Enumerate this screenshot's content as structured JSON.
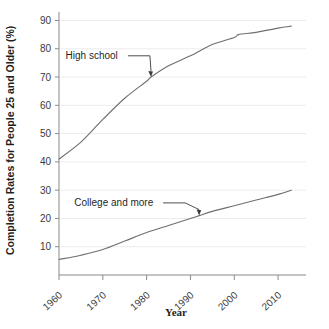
{
  "chart_data": {
    "type": "line",
    "title": "",
    "xlabel": "Year",
    "ylabel": "Completion Rates for People 25 and Older (%)",
    "xlim": [
      1960,
      2015
    ],
    "ylim": [
      0,
      93
    ],
    "xticks": [
      1960,
      1970,
      1980,
      1990,
      2000,
      2010
    ],
    "xtick_labels": [
      "1960",
      "1970",
      "1980",
      "1990",
      "2000",
      "2010"
    ],
    "yticks": [
      10,
      20,
      30,
      40,
      50,
      60,
      70,
      80,
      90
    ],
    "ytick_labels": [
      "10",
      "20",
      "30",
      "40",
      "50",
      "60",
      "70",
      "80",
      "90"
    ],
    "grid": "horizontal-faint",
    "legend_position": "inline-annotations",
    "series": [
      {
        "name": "High school",
        "x": [
          1960,
          1965,
          1970,
          1975,
          1980,
          1981,
          1985,
          1990,
          1995,
          2000,
          2001,
          2005,
          2010,
          2013
        ],
        "values": [
          41.0,
          47.0,
          55.0,
          62.5,
          68.5,
          70.0,
          74.0,
          77.5,
          81.5,
          84.0,
          85.0,
          85.8,
          87.3,
          88.0
        ]
      },
      {
        "name": "College and more",
        "x": [
          1960,
          1965,
          1970,
          1975,
          1980,
          1985,
          1990,
          1992,
          1995,
          2000,
          2005,
          2010,
          2013
        ],
        "values": [
          5.5,
          7.0,
          9.0,
          12.0,
          15.0,
          17.5,
          20.0,
          21.0,
          22.5,
          24.5,
          26.5,
          28.5,
          30.0
        ]
      }
    ],
    "annotations": [
      {
        "label": "High school",
        "label_x": 1961.5,
        "label_y": 77.5,
        "target_x": 1981,
        "target_y": 70.0
      },
      {
        "label": "College and more",
        "label_x": 1963.5,
        "label_y": 25.5,
        "target_x": 1992,
        "target_y": 21.0
      }
    ]
  }
}
